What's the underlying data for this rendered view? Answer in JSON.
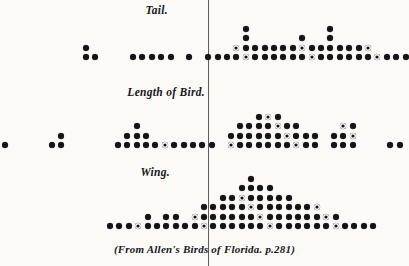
{
  "figure": {
    "caption": "(From Allen's Birds of Florida. p.281)",
    "background_color": "#fbfaf7",
    "dot_color": "#141416",
    "axis_color": "#5b5b5b"
  },
  "panels": [
    {
      "key": "tail",
      "label": "Tail.",
      "label_x": 168,
      "label_y": 4,
      "baseline_y": 60
    },
    {
      "key": "length",
      "label": "Length of Bird.",
      "label_x": 160,
      "label_y": 86,
      "baseline_y": 148
    },
    {
      "key": "wing",
      "label": "Wing.",
      "label_x": 170,
      "label_y": 166,
      "baseline_y": 229
    }
  ],
  "axis": {
    "x": 208,
    "top": 0,
    "bottom": 266,
    "label": "center-line"
  },
  "chart_data": {
    "type": "scatter",
    "subtitle": "(From Allen's Birds of Florida. p.281)",
    "xlabel": "",
    "ylabel": "Number of individuals (one dot = one bird)",
    "grid": false,
    "legend": false,
    "panels": [
      {
        "name": "Tail.",
        "label": "Tail.",
        "dot_diameter_px": 6,
        "column_pitch_px": 9.4,
        "row_pitch_px": 9.4,
        "baseline_y": 60,
        "first_column_x": 86,
        "counts": [
          2,
          1,
          0,
          0,
          0,
          1,
          1,
          1,
          1,
          1,
          0,
          1,
          0,
          1,
          1,
          1,
          2,
          4,
          2,
          2,
          2,
          2,
          2,
          3,
          2,
          2,
          4,
          2,
          2,
          2,
          2,
          1,
          1,
          1,
          1,
          0,
          0,
          1
        ]
      },
      {
        "name": "Length of Bird.",
        "label": "Length of Bird.",
        "dot_diameter_px": 6,
        "column_pitch_px": 9.4,
        "row_pitch_px": 9.4,
        "baseline_y": 148,
        "first_column_x": 5,
        "counts": [
          1,
          0,
          0,
          0,
          0,
          1,
          2,
          0,
          0,
          0,
          0,
          0,
          1,
          2,
          3,
          2,
          1,
          1,
          1,
          1,
          1,
          1,
          1,
          0,
          2,
          3,
          3,
          4,
          4,
          4,
          3,
          3,
          2,
          2,
          0,
          2,
          3,
          3,
          0,
          0,
          0,
          1,
          1,
          0,
          1
        ]
      },
      {
        "name": "Wing.",
        "label": "Wing.",
        "dot_diameter_px": 6,
        "column_pitch_px": 9.4,
        "row_pitch_px": 9.4,
        "baseline_y": 229,
        "first_column_x": 110,
        "counts": [
          1,
          1,
          1,
          1,
          2,
          1,
          2,
          2,
          1,
          2,
          3,
          3,
          4,
          4,
          5,
          6,
          5,
          5,
          4,
          4,
          3,
          3,
          3,
          2,
          2,
          1,
          1,
          1,
          1
        ]
      }
    ]
  }
}
